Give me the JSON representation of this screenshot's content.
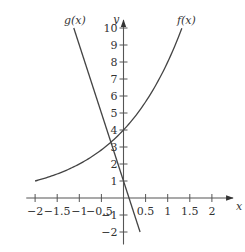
{
  "chart_data": {
    "type": "line",
    "title": "",
    "xlabel": "x",
    "ylabel": "y",
    "xlim": [
      -2.2,
      2.4
    ],
    "ylim": [
      -2.5,
      10.6
    ],
    "grid": false,
    "x_ticks": [
      -2,
      -1.5,
      -1,
      -0.5,
      0.5,
      1,
      1.5,
      2
    ],
    "x_tick_labels": [
      "−2",
      "−1.5",
      "−1",
      "−0.5",
      "0.5",
      "1",
      "1.5",
      "2"
    ],
    "y_ticks": [
      -2,
      -1,
      1,
      2,
      3,
      4,
      5,
      6,
      7,
      8,
      9,
      10
    ],
    "y_tick_labels": [
      "−2",
      "−1",
      "1",
      "2",
      "3",
      "4",
      "5",
      "6",
      "7",
      "8",
      "9",
      "10"
    ],
    "series": [
      {
        "name": "f(x)",
        "label": "f(x)",
        "description": "exponential growth, passes through (-2, 1), (0, 4), (1.32, 10)",
        "x": [
          -2,
          -1.5,
          -1,
          -0.5,
          0,
          0.25,
          0.5,
          0.75,
          1,
          1.15,
          1.32
        ],
        "values": [
          1,
          1.41,
          2,
          2.83,
          4,
          4.76,
          5.66,
          6.73,
          8,
          8.88,
          10
        ]
      },
      {
        "name": "g(x)",
        "label": "g(x)",
        "description": "decreasing line, passes through (-1.125, 10), (0, 1), (0.375, -2)",
        "x": [
          -1.125,
          0.375
        ],
        "values": [
          10,
          -2
        ]
      }
    ],
    "annotations": [
      "g(x)",
      "f(x)"
    ],
    "intersection": {
      "x": -0.28,
      "y": 3.3
    }
  },
  "layout": {
    "origin_px": [
      123.5,
      198
    ],
    "px_per_x": 44.2,
    "px_per_y": 17,
    "axis_color": "#555555",
    "curve_color": "#444444"
  }
}
